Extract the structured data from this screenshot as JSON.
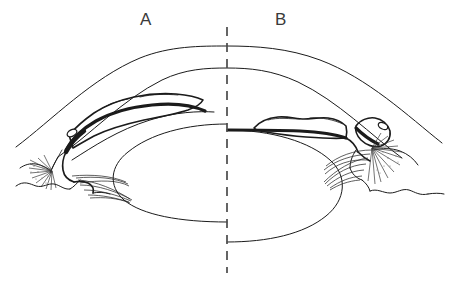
{
  "figure": {
    "type": "anatomical-line-diagram",
    "background_color": "#ffffff",
    "ink_color": "#1b1b1b",
    "label_color": "#3a3a3a",
    "stipple_color": "#6e6e6e",
    "width": 454,
    "height": 282
  },
  "labels": {
    "panel_a": "A",
    "panel_b": "B"
  },
  "panels": [
    {
      "id": "a",
      "label": "A",
      "side": "left",
      "label_x": 147,
      "label_y": 19,
      "iris_configuration": "convex-bowed",
      "angle_state": "narrow-closed",
      "membrane": "stippled-mass-on-anterior-iris-surface",
      "structures": [
        "sclera-cornea-outer-contour",
        "corneal-endothelium-inner-contour",
        "anterior-chamber",
        "iris-bowed-anteriorly",
        "stippled-membrane",
        "schlemms-canal-oval",
        "trabecular-meshwork",
        "ciliary-body-with-radial-processes",
        "zonular-fibers",
        "lens"
      ]
    },
    {
      "id": "b",
      "label": "B",
      "side": "right",
      "label_x": 282,
      "label_y": 19,
      "iris_configuration": "flat-planar",
      "angle_state": "open",
      "membrane": "stippled-mass-on-anterior-iris-surface-and-at-angle",
      "structures": [
        "sclera-cornea-outer-contour",
        "corneal-endothelium-inner-contour",
        "anterior-chamber",
        "iris-flat",
        "stippled-membrane",
        "stippled-angle-mass",
        "schlemms-canal-oval",
        "trabecular-meshwork",
        "ciliary-body-with-radial-processes",
        "zonular-fibers",
        "lens"
      ]
    }
  ],
  "midline": {
    "name": "vertical-dashed-midline",
    "x": 227,
    "y_top": 27,
    "y_bottom": 273,
    "dash": "9 7"
  },
  "geometry": {
    "lens": {
      "cx": 227,
      "cy": 182,
      "rx": 112,
      "ry": 58
    },
    "cornea_outer_apex": {
      "x": 227,
      "y": 46
    },
    "cornea_inner_apex": {
      "x": 227,
      "y": 68
    },
    "iris_left_pupil_margin": {
      "x": 204,
      "y": 112
    },
    "iris_right_pupil_margin": {
      "x": 227,
      "y": 130
    }
  }
}
